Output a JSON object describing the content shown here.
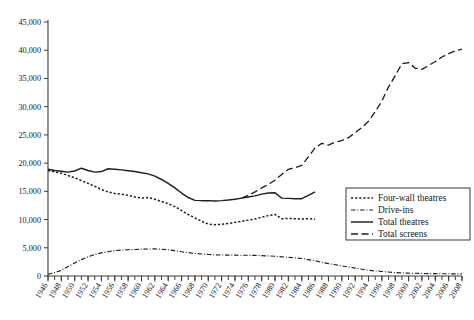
{
  "chart_data": {
    "type": "line",
    "title": "",
    "xlabel": "",
    "ylabel": "",
    "xlim": [
      1946,
      2008
    ],
    "ylim": [
      0,
      45000
    ],
    "grid": false,
    "legend_position": "right-middle",
    "ytick_labels": [
      "0",
      "5,000",
      "10,000",
      "15,000",
      "20,000",
      "25,000",
      "30,000",
      "35,000",
      "40,000",
      "45,000"
    ],
    "ytick_values": [
      0,
      5000,
      10000,
      15000,
      20000,
      25000,
      30000,
      35000,
      40000,
      45000
    ],
    "xtick_labels": [
      "1946",
      "1948",
      "1950",
      "1952",
      "1954",
      "1956",
      "1958",
      "1960",
      "1962",
      "1964",
      "1966",
      "1968",
      "1970",
      "1972",
      "1974",
      "1976",
      "1978",
      "1980",
      "1982",
      "1984",
      "1986",
      "1988",
      "1990",
      "1992",
      "1994",
      "1996",
      "1998",
      "2000",
      "2002",
      "2004",
      "2006",
      "2008"
    ],
    "xtick_values": [
      1946,
      1948,
      1950,
      1952,
      1954,
      1956,
      1958,
      1960,
      1962,
      1964,
      1966,
      1968,
      1970,
      1972,
      1974,
      1976,
      1978,
      1980,
      1982,
      1984,
      1986,
      1988,
      1990,
      1992,
      1994,
      1996,
      1998,
      2000,
      2002,
      2004,
      2006,
      2008
    ],
    "minor_tick_interval_years": 1,
    "series": [
      {
        "name": "Four-wall theatres",
        "style": "dotted",
        "color": "#1f1f1f",
        "x": [
          1946,
          1947,
          1948,
          1949,
          1950,
          1951,
          1952,
          1953,
          1954,
          1955,
          1956,
          1957,
          1958,
          1959,
          1960,
          1961,
          1962,
          1963,
          1964,
          1965,
          1966,
          1967,
          1968,
          1969,
          1970,
          1971,
          1972,
          1973,
          1974,
          1975,
          1976,
          1977,
          1978,
          1979,
          1980,
          1981,
          1982,
          1983,
          1984,
          1985,
          1986
        ],
        "values": [
          18700,
          18450,
          18200,
          17800,
          17400,
          16900,
          16400,
          15900,
          15300,
          14900,
          14600,
          14500,
          14300,
          14000,
          13800,
          13900,
          13600,
          13200,
          12800,
          12300,
          11600,
          10900,
          10300,
          9700,
          9200,
          9100,
          9150,
          9300,
          9500,
          9700,
          9900,
          10100,
          10400,
          10700,
          10900,
          10150,
          10200,
          10150,
          10100,
          10150,
          10050
        ]
      },
      {
        "name": "Drive-ins",
        "style": "dash-dot",
        "color": "#1f1f1f",
        "x": [
          1946,
          1947,
          1948,
          1949,
          1950,
          1951,
          1952,
          1953,
          1954,
          1955,
          1956,
          1957,
          1958,
          1959,
          1960,
          1961,
          1962,
          1963,
          1964,
          1965,
          1966,
          1967,
          1968,
          1969,
          1970,
          1971,
          1972,
          1973,
          1974,
          1975,
          1976,
          1977,
          1978,
          1979,
          1980,
          1981,
          1982,
          1983,
          1984,
          1985,
          1986,
          1987,
          1988,
          1989,
          1990,
          1991,
          1992,
          1993,
          1994,
          1995,
          1996,
          1997,
          1998,
          1999,
          2000,
          2001,
          2002,
          2003,
          2004,
          2005,
          2006,
          2007,
          2008
        ],
        "values": [
          300,
          600,
          1000,
          1700,
          2300,
          2900,
          3400,
          3800,
          4100,
          4300,
          4500,
          4600,
          4650,
          4700,
          4750,
          4780,
          4800,
          4750,
          4650,
          4500,
          4300,
          4150,
          4000,
          3900,
          3800,
          3750,
          3720,
          3700,
          3690,
          3680,
          3670,
          3650,
          3600,
          3550,
          3500,
          3400,
          3300,
          3200,
          3100,
          2900,
          2700,
          2400,
          2200,
          2000,
          1800,
          1600,
          1400,
          1200,
          1000,
          900,
          800,
          700,
          600,
          550,
          500,
          480,
          450,
          430,
          410,
          400,
          390,
          380,
          370
        ]
      },
      {
        "name": "Total theatres",
        "style": "solid",
        "color": "#1f1f1f",
        "x": [
          1946,
          1947,
          1948,
          1949,
          1950,
          1951,
          1952,
          1953,
          1954,
          1955,
          1956,
          1957,
          1958,
          1959,
          1960,
          1961,
          1962,
          1963,
          1964,
          1965,
          1966,
          1967,
          1968,
          1969,
          1970,
          1971,
          1972,
          1973,
          1974,
          1975,
          1976,
          1977,
          1978,
          1979,
          1980,
          1981,
          1982,
          1983,
          1984,
          1985,
          1986
        ],
        "values": [
          18900,
          18700,
          18550,
          18400,
          18600,
          19100,
          18700,
          18400,
          18500,
          19000,
          18900,
          18800,
          18650,
          18500,
          18300,
          18100,
          17700,
          17100,
          16400,
          15600,
          14700,
          13900,
          13400,
          13350,
          13350,
          13300,
          13350,
          13450,
          13600,
          13800,
          14000,
          14200,
          14500,
          14700,
          14750,
          13800,
          13750,
          13700,
          13700,
          14300,
          14900
        ]
      },
      {
        "name": "Total screens",
        "style": "long-dash",
        "color": "#1f1f1f",
        "x": [
          1975,
          1976,
          1977,
          1978,
          1979,
          1980,
          1981,
          1982,
          1983,
          1984,
          1985,
          1986,
          1987,
          1988,
          1989,
          1990,
          1991,
          1992,
          1993,
          1994,
          1995,
          1996,
          1997,
          1998,
          1999,
          2000,
          2001,
          2002,
          2003,
          2004,
          2005,
          2006,
          2007,
          2008
        ],
        "values": [
          13800,
          14300,
          14900,
          15600,
          16200,
          17000,
          18000,
          18900,
          19200,
          19600,
          21100,
          22700,
          23500,
          23200,
          23700,
          24000,
          24500,
          25400,
          26300,
          27400,
          29100,
          31000,
          33500,
          35500,
          37600,
          37800,
          36800,
          36600,
          37300,
          38000,
          38800,
          39400,
          39900,
          40200
        ]
      }
    ]
  },
  "legend": {
    "items": [
      {
        "label": "Four-wall theatres",
        "style": "dotted"
      },
      {
        "label": "Drive-ins",
        "style": "dash-dot"
      },
      {
        "label": "Total theatres",
        "style": "solid"
      },
      {
        "label": "Total screens",
        "style": "long-dash"
      }
    ]
  }
}
